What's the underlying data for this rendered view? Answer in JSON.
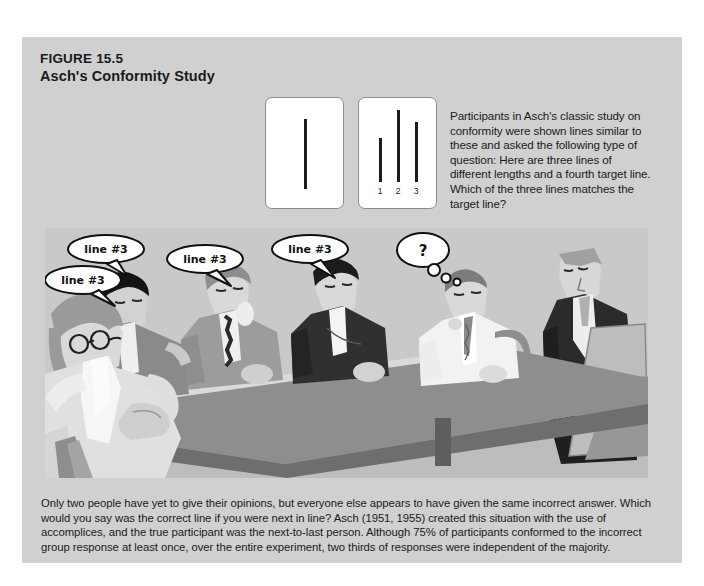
{
  "figure": {
    "label": "FIGURE 15.5",
    "subtitle": "Asch's Conformity Study",
    "background_color": "#d0d0d0",
    "caption": "Only two people have yet to give their opinions, but everyone else appears to have given the same incorrect answer. Which would you say was the correct line if you were next in line? Asch (1951, 1955) created this situation with the use of accomplices, and the true participant was the next-to-last person. Although 75% of participants conformed to the incorrect group response at least once, over the entire experiment, two thirds of responses were independent of the majority."
  },
  "stimulus": {
    "description": "Participants in Asch's classic study on conformity were shown lines similar to these and asked the following type of question: Here are three lines of different lengths and a fourth target line. Which of the three lines matches the target line?",
    "target_card": {
      "name": "target-line-card",
      "lines": [
        {
          "label": "",
          "height_px": 70,
          "left_px": 38
        }
      ]
    },
    "comparison_card": {
      "name": "comparison-lines-card",
      "labels": [
        "1",
        "2",
        "3"
      ],
      "lines": [
        {
          "label": "1",
          "height_px": 44,
          "left_px": 20
        },
        {
          "label": "2",
          "height_px": 72,
          "left_px": 38
        },
        {
          "label": "3",
          "height_px": 60,
          "left_px": 56
        }
      ]
    },
    "line_color": "#1c1c1c",
    "card_color": "#ffffff"
  },
  "illustration": {
    "alt": "Six people seated around a conference table in an Asch conformity experiment, with an experimenter standing at an easel",
    "speech_bubbles": [
      {
        "id": "bubble-1",
        "text": "line #3",
        "type": "speech"
      },
      {
        "id": "bubble-2",
        "text": "line #3",
        "type": "speech"
      },
      {
        "id": "bubble-3",
        "text": "line #3",
        "type": "speech"
      },
      {
        "id": "bubble-4",
        "text": "line #3",
        "type": "speech"
      },
      {
        "id": "bubble-5",
        "text": "?",
        "type": "thought"
      }
    ],
    "colors": {
      "panel_bg": "#c9c9c9",
      "table_top": "#8e8e8e",
      "table_side": "#6e6e6e",
      "floor": "#b9b9b9",
      "skin_light": "#e2e2e2",
      "skin_mid": "#c4c4c4",
      "hair_dark": "#1a1a1a",
      "hair_grey": "#9a9a9a",
      "suit_dark": "#2b2b2b",
      "suit_mid": "#8a8a8a",
      "shirt_light": "#f0f0f0",
      "bubble_fill": "#ffffff",
      "bubble_stroke": "#111111"
    }
  }
}
